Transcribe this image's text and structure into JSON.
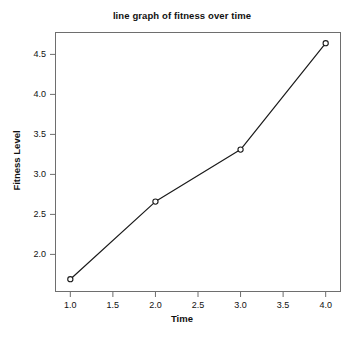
{
  "chart_data": {
    "type": "line",
    "title": "line graph of fitness over time",
    "xlabel": "Time",
    "ylabel": "Fitness Level",
    "x": [
      1.0,
      2.0,
      3.0,
      4.0
    ],
    "values": [
      1.69,
      2.66,
      3.31,
      4.64
    ],
    "series": [
      {
        "name": "Fitness Level",
        "x": [
          1.0,
          2.0,
          3.0,
          4.0
        ],
        "values": [
          1.69,
          2.66,
          3.31,
          4.64
        ]
      }
    ],
    "xlim": [
      0.82,
      4.18
    ],
    "ylim": [
      1.53,
      4.78
    ],
    "xticks": [
      1.0,
      1.5,
      2.0,
      2.5,
      3.0,
      3.5,
      4.0
    ],
    "xtick_labels": [
      "1.0",
      "1.5",
      "2.0",
      "2.5",
      "3.0",
      "3.5",
      "4.0"
    ],
    "yticks": [
      2.0,
      2.5,
      3.0,
      3.5,
      4.0,
      4.5
    ],
    "ytick_labels": [
      "2.0",
      "2.5",
      "3.0",
      "3.5",
      "4.0",
      "4.5"
    ],
    "grid": false,
    "legend": false,
    "legend_position": "none",
    "marker": "open-circle",
    "line_color": "#1a1a1a",
    "marker_color": "#1a1a1a",
    "background_color": "#ffffff",
    "frame_color": "#6e6e6e"
  }
}
